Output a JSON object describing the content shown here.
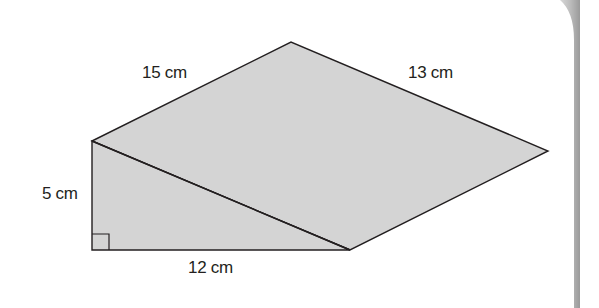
{
  "figure": {
    "type": "composite-triangle-diagram",
    "fill_color": "#d4d4d4",
    "stroke_color": "#231f20",
    "vertices": {
      "top": [
        291,
        42
      ],
      "left_top": [
        92,
        141
      ],
      "left_bottom": [
        92,
        250
      ],
      "bottom_right": [
        350,
        250
      ],
      "right": [
        548,
        151
      ]
    },
    "labels": {
      "top_left_edge": "15 cm",
      "top_right_edge": "13 cm",
      "left_vertical_edge": "5 cm",
      "bottom_edge": "12 cm"
    },
    "right_angle_marker": true
  },
  "page_edge": {
    "color": "#c8c8c8"
  }
}
